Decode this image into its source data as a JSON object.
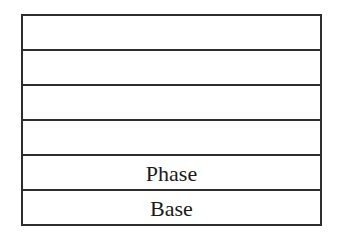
{
  "diagram": {
    "type": "layered-stack",
    "layers": [
      {
        "label": ""
      },
      {
        "label": ""
      },
      {
        "label": ""
      },
      {
        "label": ""
      },
      {
        "label": "Phase"
      },
      {
        "label": "Base"
      }
    ],
    "colors": {
      "line": "#2e2e2e",
      "text": "#1a1a1a",
      "background": "#ffffff"
    }
  }
}
